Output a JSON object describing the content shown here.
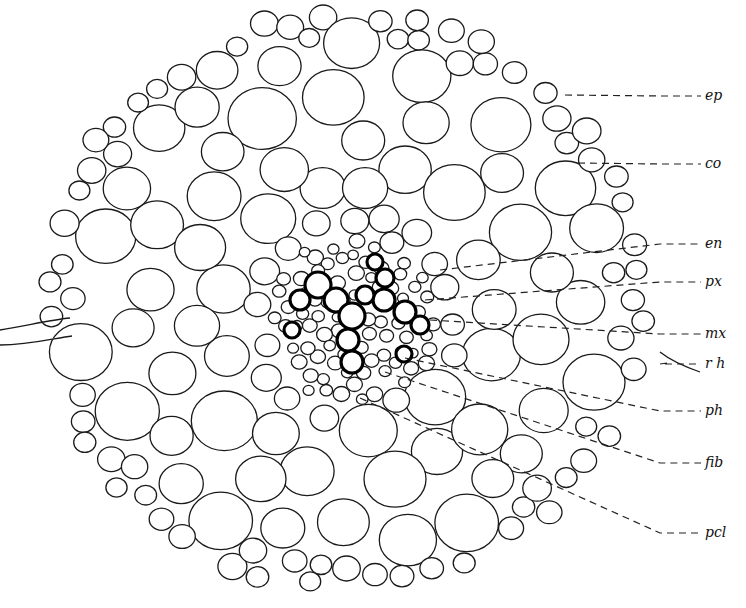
{
  "figure": {
    "outline": {
      "cx": 345,
      "cy": 300,
      "rx": 300,
      "ry": 290
    },
    "stele": {
      "cx": 355,
      "cy": 320,
      "r": 85
    },
    "root_hairs": [
      {
        "path": "M0,330 C30,325 50,320 70,318"
      },
      {
        "path": "M0,345 C30,345 55,338 72,336"
      },
      {
        "path": "M660,352 C670,360 680,365 700,372"
      }
    ],
    "xylem_cells": [
      [
        318,
        285,
        13
      ],
      [
        336,
        300,
        12
      ],
      [
        352,
        316,
        13
      ],
      [
        348,
        340,
        11
      ],
      [
        352,
        362,
        11
      ],
      [
        300,
        300,
        10
      ],
      [
        384,
        300,
        11
      ],
      [
        405,
        312,
        11
      ],
      [
        385,
        278,
        9
      ],
      [
        365,
        295,
        9
      ],
      [
        292,
        330,
        8
      ],
      [
        404,
        354,
        8
      ],
      [
        375,
        262,
        8
      ],
      [
        420,
        325,
        9
      ]
    ]
  },
  "labels": [
    {
      "text": "ep",
      "x": 705,
      "y": 100,
      "from": [
        565,
        95
      ]
    },
    {
      "text": "co",
      "x": 705,
      "y": 168,
      "from": [
        578,
        163
      ]
    },
    {
      "text": "en",
      "x": 705,
      "y": 248,
      "from": [
        440,
        270
      ]
    },
    {
      "text": "px",
      "x": 705,
      "y": 286,
      "from": [
        425,
        300
      ]
    },
    {
      "text": "mx",
      "x": 705,
      "y": 338,
      "from": [
        430,
        320
      ]
    },
    {
      "text": "r h",
      "x": 705,
      "y": 368,
      "from": [
        667,
        363
      ]
    },
    {
      "text": "ph",
      "x": 705,
      "y": 415,
      "from": [
        405,
        358
      ]
    },
    {
      "text": "fib",
      "x": 705,
      "y": 467,
      "from": [
        385,
        372
      ]
    },
    {
      "text": "pcl",
      "x": 705,
      "y": 537,
      "from": [
        360,
        398
      ]
    }
  ]
}
